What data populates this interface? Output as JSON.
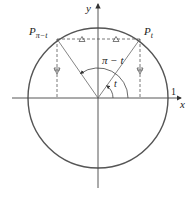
{
  "diagram": {
    "type": "unit-circle",
    "axes": {
      "x_label": "x",
      "y_label": "y",
      "unit_tick_label": "1"
    },
    "points": {
      "p_t": {
        "label": "P",
        "subscript": "t"
      },
      "p_pi_minus_t": {
        "label": "P",
        "subscript": "π−t"
      }
    },
    "angles": {
      "t": "t",
      "pi_minus_t": "π − t"
    },
    "colors": {
      "circle": "#555555",
      "axes": "#444444",
      "lines": "#666666",
      "text": "#222222"
    }
  }
}
